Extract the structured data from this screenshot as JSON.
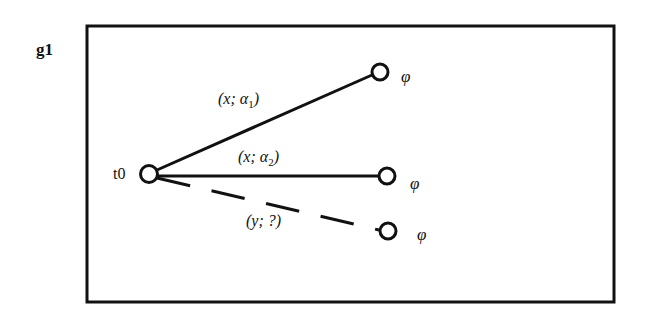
{
  "graph": {
    "label": "g1",
    "root": {
      "label": "t0"
    },
    "edges": [
      {
        "label_main": "(x; α",
        "label_sub": "1",
        "label_end": ")",
        "style": "solid",
        "target_label": "φ"
      },
      {
        "label_main": "(x; α",
        "label_sub": "2",
        "label_end": ")",
        "style": "solid",
        "target_label": "φ"
      },
      {
        "label_main": "(y; ?)",
        "style": "dashed",
        "target_label": "φ"
      }
    ]
  }
}
